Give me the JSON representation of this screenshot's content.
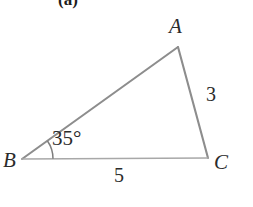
{
  "figure": {
    "part_label": "(a)",
    "background_color": "#ffffff",
    "stroke_color": "#8a8a8a",
    "stroke_color_base": "#a6a6a6",
    "text_color": "#2b2b2b",
    "width": 253,
    "height": 207
  },
  "triangle": {
    "vertices": [
      {
        "name": "A",
        "label": "A",
        "x": 178,
        "y": 47
      },
      {
        "name": "B",
        "label": "B",
        "x": 22,
        "y": 159
      },
      {
        "name": "C",
        "label": "C",
        "x": 208,
        "y": 158
      }
    ],
    "sides": [
      {
        "name": "AB",
        "label": "",
        "from": "A",
        "to": "B"
      },
      {
        "name": "AC",
        "label": "3",
        "from": "A",
        "to": "C"
      },
      {
        "name": "BC",
        "label": "5",
        "from": "B",
        "to": "C"
      }
    ],
    "angles": [
      {
        "at": "B",
        "label": "35°",
        "value": 35,
        "unit": "degrees",
        "arc_radius": 31
      }
    ]
  },
  "labels": {
    "vertex_a": "A",
    "vertex_b": "B",
    "vertex_c": "C",
    "side_ac": "3",
    "side_bc": "5",
    "angle_b": "35°"
  }
}
